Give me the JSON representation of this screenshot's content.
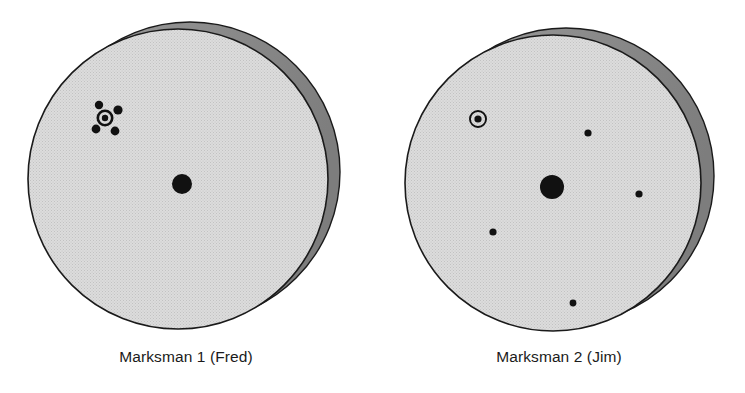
{
  "figure": {
    "width": 745,
    "height": 393,
    "background_color": "#ffffff",
    "caption_color": "#1b1b1b"
  },
  "palette": {
    "disc_face": "#dcdcdc",
    "disc_rim": "#8a8a8a",
    "outline": "#1a1a1a",
    "shot_mark": "#111111",
    "texture_dot": "#c2c2c2"
  },
  "chart_data": {
    "type": "scatter",
    "title": "",
    "xlabel": "",
    "ylabel": "",
    "panels": [
      {
        "id": "target-1",
        "label": "Marksman 1 (Fred)",
        "face": {
          "cx": 178,
          "cy": 179,
          "r": 150
        },
        "rim": {
          "cx": 190,
          "cy": 172,
          "r": 150
        },
        "aim_point": {
          "x": 182,
          "y": 184,
          "r": 10,
          "kind": "solid-dot"
        },
        "bullseye": {
          "x": 105,
          "y": 118,
          "outer_r": 8.5,
          "ring_w": 2.6,
          "inner_r": 3.2,
          "kind": "ring-dot"
        },
        "shots": [
          {
            "x": 99,
            "y": 105,
            "r": 4.2
          },
          {
            "x": 118,
            "y": 110,
            "r": 4.6
          },
          {
            "x": 96,
            "y": 129,
            "r": 4.4
          },
          {
            "x": 115,
            "y": 131,
            "r": 4.4
          }
        ]
      },
      {
        "id": "target-2",
        "label": "Marksman 2 (Jim)",
        "face": {
          "cx": 553,
          "cy": 183,
          "r": 148
        },
        "rim": {
          "cx": 566,
          "cy": 176,
          "r": 148
        },
        "aim_point": {
          "x": 552,
          "y": 187,
          "r": 12,
          "kind": "solid-dot"
        },
        "bullseye": {
          "x": 478,
          "y": 119,
          "outer_r": 9,
          "ring_w": 1.9,
          "inner_r": 3.6,
          "kind": "ring-dot"
        },
        "shots": [
          {
            "x": 588,
            "y": 133,
            "r": 3.6
          },
          {
            "x": 639,
            "y": 194,
            "r": 3.6
          },
          {
            "x": 493,
            "y": 232,
            "r": 3.6
          },
          {
            "x": 573,
            "y": 303,
            "r": 3.4
          }
        ]
      }
    ]
  },
  "captions": {
    "target_1": "Marksman 1 (Fred)",
    "target_2": "Marksman 2 (Jim)"
  },
  "caption_positions": {
    "target_1": {
      "left": 0,
      "width": 372,
      "top": 348
    },
    "target_2": {
      "left": 373,
      "width": 372,
      "top": 348
    }
  }
}
